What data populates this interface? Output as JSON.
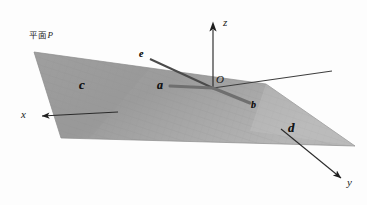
{
  "figure": {
    "kind": "3d-geometry-diagram",
    "background_color": "#fdfdfd",
    "width": 367,
    "height": 205,
    "plane": {
      "label_prefix": "平面",
      "label_name": "P",
      "label_full": "平面P",
      "fill_color": "#9a9a9a",
      "fill_color_light": "#b3b3b3",
      "edge_color": "#8a8a8a",
      "hatch_color": "#8e8e8e",
      "vertices": [
        [
          34,
          52
        ],
        [
          266,
          84
        ],
        [
          355,
          146
        ],
        [
          61,
          138
        ]
      ]
    },
    "axes": [
      {
        "name": "z",
        "label": "z",
        "from": [
          213,
          88
        ],
        "to": [
          213,
          24
        ],
        "color": "#2a2a2a",
        "arrow": true
      },
      {
        "name": "y",
        "label": "y",
        "from": [
          283,
          131
        ],
        "to": [
          345,
          181
        ],
        "color": "#2a2a2a",
        "arrow": true
      },
      {
        "name": "x",
        "label": "x",
        "from": [
          115,
          112
        ],
        "to": [
          36,
          116
        ],
        "color": "#2a2a2a",
        "arrow": true
      },
      {
        "name": "horizontal-guide",
        "label": "",
        "from": [
          213,
          88
        ],
        "to": [
          330,
          72
        ],
        "color": "#3a3a3a",
        "arrow": false
      }
    ],
    "origin": {
      "label": "O",
      "at": [
        213,
        88
      ]
    },
    "vectors": [
      {
        "name": "a",
        "label": "a",
        "from": [
          213,
          88
        ],
        "to": [
          166,
          86
        ],
        "color": "#6e6e6e",
        "width": 3.2,
        "label_at": [
          158,
          80
        ]
      },
      {
        "name": "b",
        "label": "b",
        "from": [
          213,
          88
        ],
        "to": [
          252,
          104
        ],
        "color": "#6e6e6e",
        "width": 3.2,
        "label_at": [
          252,
          101
        ]
      },
      {
        "name": "e",
        "label": "e",
        "from": [
          213,
          88
        ],
        "to": [
          148,
          58
        ],
        "color": "#4a4a4a",
        "width": 2.2,
        "label_at": [
          140,
          49
        ]
      }
    ],
    "region_labels": [
      {
        "name": "c",
        "label": "c",
        "at": [
          80,
          79
        ]
      },
      {
        "name": "d",
        "label": "d",
        "at": [
          289,
          123
        ]
      }
    ],
    "plane_label_at": [
      30,
      31
    ]
  },
  "chart_data": {
    "type": "diagram",
    "title": "",
    "description_labels": [
      "平面P",
      "x",
      "y",
      "z",
      "O",
      "a",
      "b",
      "c",
      "d",
      "e"
    ]
  }
}
